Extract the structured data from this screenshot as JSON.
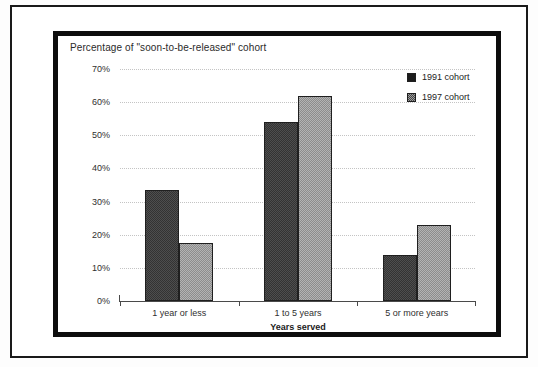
{
  "chart_data": {
    "type": "bar",
    "title": "Percentage of \"soon-to-be-released\" cohort",
    "xlabel": "Years served",
    "ylabel": "",
    "categories": [
      "1 year or less",
      "1 to 5 years",
      "5 or more years"
    ],
    "series": [
      {
        "name": "1991 cohort",
        "color": "#4e4e4e",
        "values": [
          33.5,
          54,
          14
        ]
      },
      {
        "name": "1997 cohort",
        "color": "#b3b3b3",
        "values": [
          17.5,
          62,
          23
        ]
      }
    ],
    "ylim": [
      0,
      70
    ],
    "ytick_labels": [
      "0%",
      "10%",
      "20%",
      "30%",
      "40%",
      "50%",
      "60%",
      "70%"
    ],
    "ytick_values": [
      0,
      10,
      20,
      30,
      40,
      50,
      60,
      70
    ],
    "grid": true,
    "legend_position": "top-right"
  }
}
